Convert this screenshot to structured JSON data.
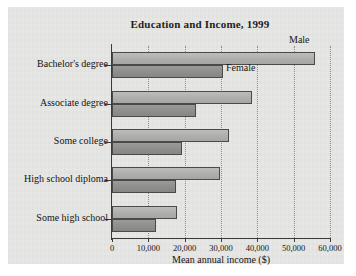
{
  "chart_data": {
    "type": "bar",
    "orientation": "horizontal",
    "title": "Education and Income, 1999",
    "xlabel": "Mean annual income ($)",
    "ylabel": "",
    "xlim": [
      0,
      60000
    ],
    "xticks": [
      0,
      10000,
      20000,
      30000,
      40000,
      50000,
      60000
    ],
    "xticklabels": [
      "0",
      "10,000",
      "20,000",
      "30,000",
      "40,000",
      "50,000",
      "60,000"
    ],
    "grid": "vertical-dotted",
    "legend_position": "inline-annotation",
    "categories": [
      "Bachelor's degree",
      "Associate degree",
      "Some college",
      "High school diploma",
      "Some high school"
    ],
    "series": [
      {
        "name": "Male",
        "color": "#aeaeac",
        "values": [
          55900,
          38500,
          32200,
          29700,
          17900
        ]
      },
      {
        "name": "Female",
        "color": "#8e8e8c",
        "values": [
          30500,
          23100,
          19300,
          17600,
          12100
        ]
      }
    ],
    "annotations": [
      {
        "text": "Male",
        "series": "Male",
        "category": "Bachelor's degree"
      },
      {
        "text": "Female",
        "series": "Female",
        "category": "Bachelor's degree"
      }
    ]
  },
  "figure": {
    "panel_color": "#e7e7e5",
    "page_color": "#ffffff",
    "axis_color": "#3a3a3a"
  }
}
